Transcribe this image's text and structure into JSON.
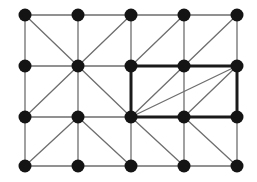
{
  "diagram": {
    "type": "triangulated-grid-graph",
    "columns_x": [
      25,
      78,
      131,
      184,
      237
    ],
    "rows_y": [
      15,
      66,
      117,
      166
    ],
    "node_radius": 6.5,
    "colors": {
      "background": "#ffffff",
      "node": "#141414",
      "edge": "#6e6e6e",
      "highlight_edge": "#1a1a1a"
    },
    "grid_edges": "all horizontal and vertical neighbors connected",
    "diagonal_edges": [
      [
        [
          0,
          0
        ],
        [
          1,
          1
        ]
      ],
      [
        [
          2,
          0
        ],
        [
          1,
          1
        ]
      ],
      [
        [
          3,
          0
        ],
        [
          2,
          1
        ]
      ],
      [
        [
          4,
          0
        ],
        [
          3,
          1
        ]
      ],
      [
        [
          1,
          1
        ],
        [
          0,
          2
        ]
      ],
      [
        [
          1,
          1
        ],
        [
          2,
          2
        ]
      ],
      [
        [
          3,
          1
        ],
        [
          2,
          2
        ]
      ],
      [
        [
          4,
          1
        ],
        [
          2,
          2
        ]
      ],
      [
        [
          4,
          1
        ],
        [
          3,
          2
        ]
      ],
      [
        [
          1,
          2
        ],
        [
          0,
          3
        ]
      ],
      [
        [
          1,
          2
        ],
        [
          2,
          3
        ]
      ],
      [
        [
          2,
          2
        ],
        [
          3,
          3
        ]
      ],
      [
        [
          3,
          2
        ],
        [
          4,
          3
        ]
      ]
    ],
    "highlight_rectangle": {
      "from": [
        2,
        1
      ],
      "to": [
        4,
        2
      ],
      "description": "thick-bordered rectangle spanning columns 2-4, rows 1-2"
    }
  }
}
